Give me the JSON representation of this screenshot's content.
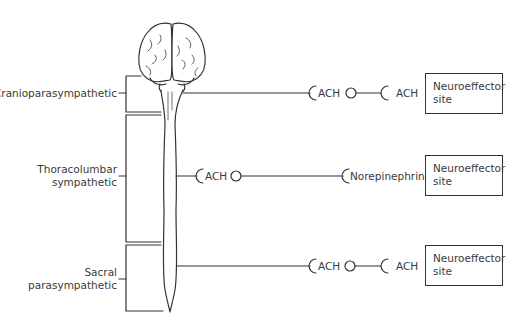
{
  "diagram": {
    "divisions": [
      {
        "id": "cranio",
        "label_lines": [
          "Cranioparasympathetic"
        ]
      },
      {
        "id": "thoraco",
        "label_lines": [
          "Thoracolumbar",
          "sympathetic"
        ]
      },
      {
        "id": "sacral",
        "label_lines": [
          "Sacral",
          "parasympathetic"
        ]
      }
    ],
    "pathways": [
      {
        "division": "cranio",
        "preganglionic_transmitter": "ACH",
        "postganglionic_transmitter": "ACH",
        "target_lines": [
          "Neuroeffector",
          "site"
        ]
      },
      {
        "division": "thoraco",
        "preganglionic_transmitter": "ACH",
        "postganglionic_transmitter": "Norepinephrine",
        "target_lines": [
          "Neuroeffector",
          "site"
        ]
      },
      {
        "division": "sacral",
        "preganglionic_transmitter": "ACH",
        "postganglionic_transmitter": "ACH",
        "target_lines": [
          "Neuroeffector",
          "site"
        ]
      }
    ],
    "line_color": "#333333",
    "text_color": "#3a3a3a"
  }
}
